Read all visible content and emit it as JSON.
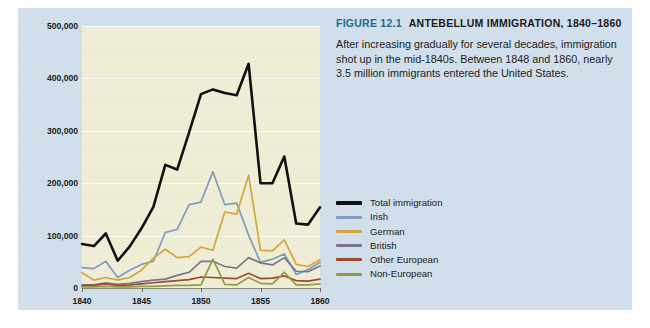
{
  "figure": {
    "number_label": "FIGURE 12.1",
    "title": "ANTEBELLUM IMMIGRATION, 1840–1860",
    "caption": "After increasing gradually for several decades, immigration shot up in the mid-1840s. Between 1848 and 1860, nearly 3.5 million immigrants entered the United States.",
    "number_color": "#1b6b8c",
    "panel_color": "#cfdeea",
    "plot_bg_color": "#efecd4"
  },
  "legend": {
    "position": "right",
    "items": [
      {
        "label": "Total immigration",
        "color": "#111111",
        "thick": true
      },
      {
        "label": "Irish",
        "color": "#7f9dbd",
        "thick": false
      },
      {
        "label": "German",
        "color": "#d2a63f",
        "thick": false
      },
      {
        "label": "British",
        "color": "#7e7490",
        "thick": false
      },
      {
        "label": "Other European",
        "color": "#9e4a2a",
        "thick": false
      },
      {
        "label": "Non-European",
        "color": "#8f9b46",
        "thick": false
      }
    ]
  },
  "chart_data": {
    "type": "line",
    "title": "ANTEBELLUM IMMIGRATION, 1840–1860",
    "xlabel": "",
    "ylabel": "",
    "grid": true,
    "xlim": [
      1840,
      1860
    ],
    "ylim": [
      0,
      500000
    ],
    "ytick_labels": [
      "0",
      "100,000",
      "200,000",
      "300,000",
      "400,000",
      "500,000"
    ],
    "yticks": [
      0,
      100000,
      200000,
      300000,
      400000,
      500000
    ],
    "xtick_labels": [
      "1840",
      "1845",
      "1850",
      "1855",
      "1860"
    ],
    "xticks": [
      1840,
      1845,
      1850,
      1855,
      1860
    ],
    "x": [
      1840,
      1841,
      1842,
      1843,
      1844,
      1845,
      1846,
      1847,
      1848,
      1849,
      1850,
      1851,
      1852,
      1853,
      1854,
      1855,
      1856,
      1857,
      1858,
      1859,
      1860
    ],
    "series": [
      {
        "name": "Total immigration",
        "color": "#111111",
        "values": [
          84000,
          80000,
          104000,
          52000,
          79000,
          114000,
          155000,
          235000,
          226000,
          297000,
          370000,
          379000,
          372000,
          368000,
          428000,
          200000,
          200000,
          251000,
          123000,
          121000,
          154000
        ]
      },
      {
        "name": "Irish",
        "color": "#7f9dbd",
        "values": [
          39000,
          37000,
          51000,
          20000,
          34000,
          45000,
          51000,
          106000,
          112000,
          159000,
          164000,
          222000,
          159000,
          162000,
          101000,
          49000,
          55000,
          65000,
          26000,
          35000,
          49000
        ]
      },
      {
        "name": "German",
        "color": "#d2a63f",
        "values": [
          29000,
          15000,
          20000,
          15000,
          20000,
          34000,
          57000,
          74000,
          58000,
          60000,
          78000,
          72000,
          145000,
          141000,
          215000,
          72000,
          71000,
          92000,
          45000,
          41000,
          54000
        ]
      },
      {
        "name": "British",
        "color": "#7e7490",
        "values": [
          6000,
          6000,
          10000,
          7000,
          9000,
          12000,
          15000,
          17000,
          24000,
          30000,
          51000,
          51000,
          41000,
          38000,
          58000,
          48000,
          44000,
          58000,
          32000,
          31000,
          42000
        ]
      },
      {
        "name": "Other European",
        "color": "#9e4a2a",
        "values": [
          5000,
          5000,
          8000,
          5000,
          6000,
          8000,
          10000,
          12000,
          14000,
          16000,
          21000,
          20000,
          19000,
          18000,
          28000,
          18000,
          19000,
          23000,
          14000,
          13000,
          17000
        ]
      },
      {
        "name": "Non-European",
        "color": "#8f9b46",
        "values": [
          2000,
          2000,
          3000,
          2000,
          2000,
          3000,
          3000,
          4000,
          5000,
          5000,
          6000,
          55000,
          7000,
          6000,
          20000,
          9000,
          8000,
          30000,
          6000,
          6000,
          8000
        ]
      }
    ]
  }
}
